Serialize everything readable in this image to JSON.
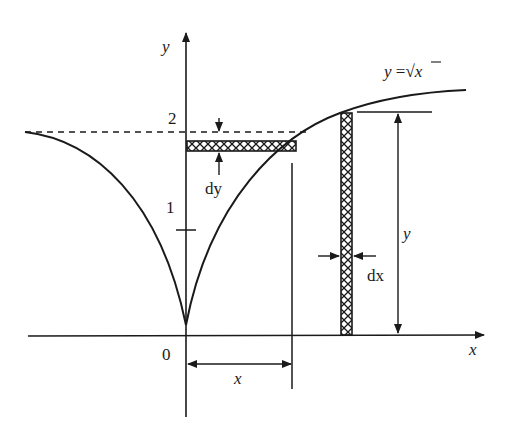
{
  "diagram": {
    "curve_label": "y = √x",
    "curve_label_parts": {
      "lhs": "y",
      "eq": " =",
      "sqrt": "√",
      "arg": "x"
    },
    "axes": {
      "x_label": "x",
      "y_label": "y",
      "origin_label": "0"
    },
    "ticks": [
      {
        "label": "1"
      },
      {
        "label": "2"
      }
    ],
    "horizontal_strip": {
      "width_label": "dy"
    },
    "vertical_strip": {
      "width_label": "dx"
    },
    "dimensions": {
      "horizontal_label": "x",
      "vertical_label": "y"
    },
    "colors": {
      "stroke": "#1a1a1a",
      "background": "#ffffff"
    }
  }
}
